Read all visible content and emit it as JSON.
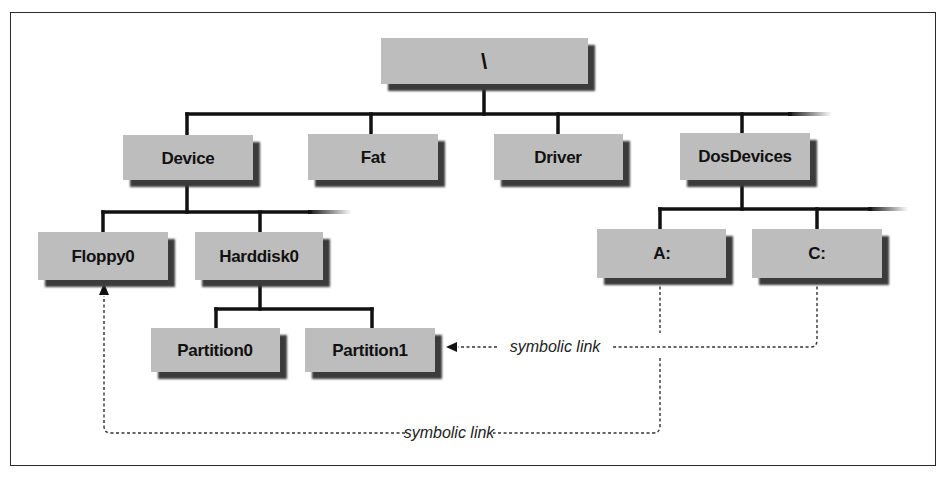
{
  "diagram": {
    "colors": {
      "box_fill": "#bdbdbd",
      "box_shadow": "#3a3a3a",
      "line": "#111111",
      "dashed_line": "#333333",
      "border": "#2a2a2a"
    },
    "nodes": {
      "root": {
        "label": "\\",
        "x": 381,
        "y": 38,
        "w": 207,
        "h": 46
      },
      "device": {
        "label": "Device",
        "x": 123,
        "y": 135,
        "w": 130,
        "h": 45
      },
      "fat": {
        "label": "Fat",
        "x": 308,
        "y": 134,
        "w": 130,
        "h": 46
      },
      "driver": {
        "label": "Driver",
        "x": 494,
        "y": 134,
        "w": 129,
        "h": 46
      },
      "dosdevices": {
        "label": "DosDevices",
        "x": 680,
        "y": 133,
        "w": 130,
        "h": 47
      },
      "floppy0": {
        "label": "Floppy0",
        "x": 38,
        "y": 232,
        "w": 130,
        "h": 48
      },
      "harddisk0": {
        "label": "Harddisk0",
        "x": 195,
        "y": 232,
        "w": 128,
        "h": 48
      },
      "a": {
        "label": "A:",
        "x": 597,
        "y": 229,
        "w": 129,
        "h": 49
      },
      "c": {
        "label": "C:",
        "x": 752,
        "y": 229,
        "w": 130,
        "h": 49
      },
      "partition0": {
        "label": "Partition0",
        "x": 151,
        "y": 328,
        "w": 129,
        "h": 44
      },
      "partition1": {
        "label": "Partition1",
        "x": 305,
        "y": 328,
        "w": 130,
        "h": 44
      }
    },
    "edges": [
      {
        "from": "root",
        "to": "device"
      },
      {
        "from": "root",
        "to": "fat"
      },
      {
        "from": "root",
        "to": "driver"
      },
      {
        "from": "root",
        "to": "dosdevices"
      },
      {
        "from": "device",
        "to": "floppy0"
      },
      {
        "from": "device",
        "to": "harddisk0"
      },
      {
        "from": "harddisk0",
        "to": "partition0"
      },
      {
        "from": "harddisk0",
        "to": "partition1"
      },
      {
        "from": "dosdevices",
        "to": "a"
      },
      {
        "from": "dosdevices",
        "to": "c"
      }
    ],
    "symbolic_links": [
      {
        "from": "c",
        "to": "partition1",
        "label": "symbolic link"
      },
      {
        "from": "a",
        "to": "floppy0",
        "label": "symbolic link"
      }
    ]
  }
}
